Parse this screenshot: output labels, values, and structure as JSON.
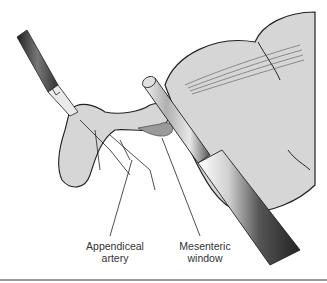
{
  "figure": {
    "labels": [
      {
        "id": "appendiceal-artery",
        "line1": "Appendiceal",
        "line2": "artery"
      },
      {
        "id": "mesenteric-window",
        "line1": "Mesenteric",
        "line2": "window"
      }
    ],
    "colors": {
      "tissue": "#d9d9d9",
      "tissue_dark": "#a8a8a8",
      "outline": "#222222",
      "instrument_dark": "#3a3a3a",
      "instrument_light": "#f0f0f0",
      "rule": "#9a9a9a"
    }
  }
}
